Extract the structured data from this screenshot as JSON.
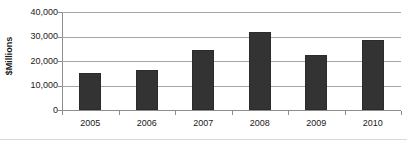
{
  "chart_data": {
    "type": "bar",
    "title": "",
    "subtitle": "",
    "xlabel": "",
    "ylabel": "$Millions",
    "categories": [
      "2005",
      "2006",
      "2007",
      "2008",
      "2009",
      "2010"
    ],
    "values": [
      15100,
      16300,
      24400,
      31800,
      22400,
      28600
    ],
    "series": [
      {
        "name": "",
        "values": [
          15100,
          16300,
          24400,
          31800,
          22400,
          28600
        ]
      }
    ],
    "ylim": [
      0,
      40000
    ],
    "yticks": [
      0,
      10000,
      20000,
      30000,
      40000
    ],
    "ytick_labels": [
      "0",
      "10,000",
      "20,000",
      "30,000",
      "40,000"
    ],
    "xtick_labels": [
      "2005",
      "2006",
      "2007",
      "2008",
      "2009",
      "2010"
    ],
    "grid": true,
    "grid_axis": "y",
    "legend": false,
    "legend_position": "none",
    "bar_color": "#333333",
    "gridline_color": "#a6a6a6",
    "axis_color": "#8c8c8c",
    "text_color": "#1a1a1a",
    "background": "#ffffff",
    "annotations": []
  }
}
